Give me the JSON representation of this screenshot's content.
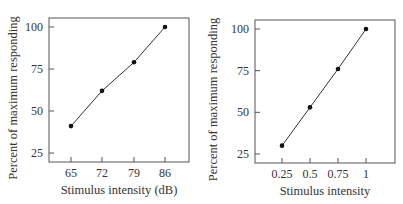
{
  "chart_data": [
    {
      "type": "line",
      "title": "",
      "xlabel": "Stimulus intensity (dB)",
      "ylabel": "Percent of maximum responding",
      "categories": [
        "65",
        "72",
        "79",
        "86"
      ],
      "x": [
        65,
        72,
        79,
        86
      ],
      "values": [
        41,
        62,
        79,
        100
      ],
      "yticks": [
        "25",
        "50",
        "75",
        "100"
      ],
      "ylim": [
        20,
        105
      ],
      "grid": false,
      "markers": true
    },
    {
      "type": "line",
      "title": "",
      "xlabel": "Stimulus intensity",
      "ylabel": "Percent of maximum responding",
      "categories": [
        "0.25",
        "0.5",
        "0.75",
        "1"
      ],
      "x": [
        0.25,
        0.5,
        0.75,
        1
      ],
      "values": [
        30,
        53,
        76,
        100
      ],
      "yticks": [
        "25",
        "50",
        "75",
        "100"
      ],
      "ylim": [
        20,
        105
      ],
      "grid": false,
      "markers": true
    }
  ],
  "colors": {
    "line": "#333333",
    "axis": "#555555",
    "marker": "#111111"
  }
}
